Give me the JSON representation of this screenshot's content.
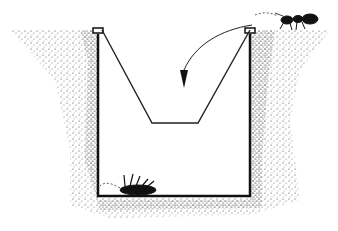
{
  "figure": {
    "type": "illustration",
    "elements": [
      {
        "name": "soil",
        "description": "stippled ground surrounding a dug pit"
      },
      {
        "name": "trap-container",
        "description": "open-topped rectangular container sunk flush with soil surface"
      },
      {
        "name": "funnel-insert",
        "description": "V-shaped funnel hung from container rim with a narrow opening"
      },
      {
        "name": "ant",
        "description": "ant walking on soil surface at right rim"
      },
      {
        "name": "fall-arrow",
        "description": "curved arrow from ant into funnel opening"
      },
      {
        "name": "trapped-beetle",
        "description": "insect lying on its back at bottom of container"
      }
    ],
    "colors": {
      "ink": "#111111",
      "paper": "#ffffff"
    }
  }
}
